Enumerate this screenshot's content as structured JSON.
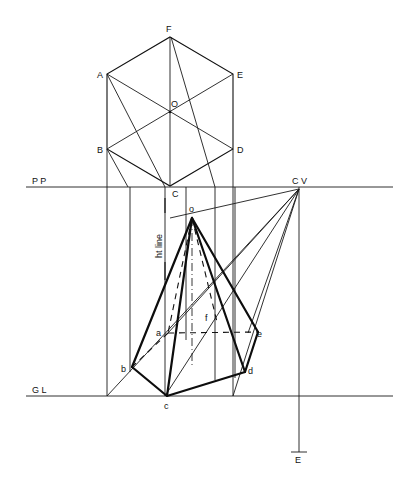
{
  "figure": {
    "plan_labels": {
      "F": "F",
      "A": "A",
      "E": "E",
      "O": "O",
      "B": "B",
      "D": "D",
      "C": "C"
    },
    "reference_lines": {
      "picture_plane": "P P",
      "ground_line": "G L",
      "center_of_vision": "C V",
      "eye": "E",
      "height_line": "ht line"
    },
    "perspective_labels": {
      "apex": "o",
      "a": "a",
      "b": "b",
      "c": "c",
      "d": "d",
      "e": "e",
      "f": "f"
    }
  }
}
